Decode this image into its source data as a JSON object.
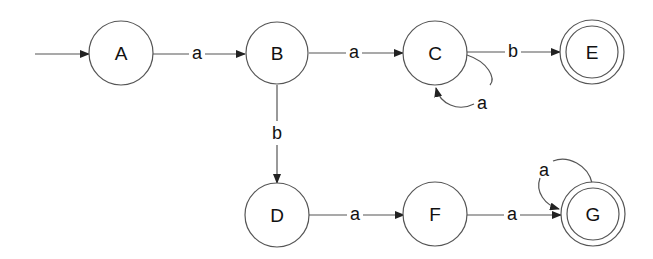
{
  "diagram": {
    "type": "finite-automaton",
    "start_state": "A",
    "states": {
      "A": {
        "label": "A",
        "accepting": false
      },
      "B": {
        "label": "B",
        "accepting": false
      },
      "C": {
        "label": "C",
        "accepting": false
      },
      "D": {
        "label": "D",
        "accepting": false
      },
      "E": {
        "label": "E",
        "accepting": true
      },
      "F": {
        "label": "F",
        "accepting": false
      },
      "G": {
        "label": "G",
        "accepting": true
      }
    },
    "transitions": [
      {
        "from": "A",
        "to": "B",
        "symbol": "a"
      },
      {
        "from": "B",
        "to": "C",
        "symbol": "a"
      },
      {
        "from": "C",
        "to": "C",
        "symbol": "a"
      },
      {
        "from": "C",
        "to": "E",
        "symbol": "b"
      },
      {
        "from": "B",
        "to": "D",
        "symbol": "b"
      },
      {
        "from": "D",
        "to": "F",
        "symbol": "a"
      },
      {
        "from": "F",
        "to": "G",
        "symbol": "a"
      },
      {
        "from": "G",
        "to": "G",
        "symbol": "a"
      }
    ],
    "colors": {
      "stroke": "#555555",
      "text": "#111111",
      "background": "#ffffff"
    }
  }
}
